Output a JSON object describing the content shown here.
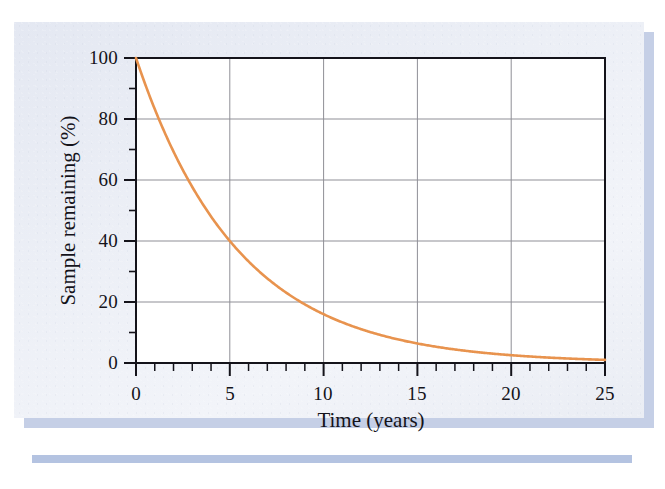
{
  "figure": {
    "kind": "scientific-figure-scan",
    "card_background": "#e9ecf4",
    "shadow_color": "#aebddd",
    "plot_background": "#ffffff"
  },
  "chart_data": {
    "type": "line",
    "title": "",
    "subtitle": "",
    "xlabel": "Time (years)",
    "ylabel": "Sample remaining (%)",
    "xlim": [
      0,
      25
    ],
    "ylim": [
      0,
      100
    ],
    "x_major_ticks": [
      0,
      5,
      10,
      15,
      20,
      25
    ],
    "x_major_tick_labels": [
      "0",
      "5",
      "10",
      "15",
      "20",
      "25"
    ],
    "x_minor_tick_step": 1,
    "y_major_ticks": [
      0,
      20,
      40,
      60,
      80,
      100
    ],
    "y_major_tick_labels": [
      "0",
      "20",
      "40",
      "60",
      "80",
      "100"
    ],
    "y_minor_ticks": [
      10,
      30,
      50,
      70,
      90
    ],
    "grid": "major-xy",
    "grid_color": "#8f8f96",
    "axis_color": "#14131a",
    "legend": null,
    "legend_position": "none",
    "annotations": [],
    "series": [
      {
        "name": "Sample remaining",
        "color": "#e8934e",
        "line_width": 2.6,
        "model": "exponential decay: 100 * exp(-0.1833 * t)",
        "half_life_years": 3.78,
        "x": [
          0,
          1,
          2,
          3,
          4,
          5,
          6,
          7,
          8,
          9,
          10,
          11,
          12,
          13,
          14,
          15,
          16,
          17,
          18,
          19,
          20,
          21,
          22,
          23,
          24,
          25
        ],
        "values": [
          100,
          83.3,
          69.4,
          57.8,
          48.1,
          40.0,
          33.3,
          27.8,
          23.1,
          19.3,
          16.0,
          13.4,
          11.1,
          9.3,
          7.7,
          6.4,
          5.3,
          4.4,
          3.7,
          3.1,
          2.6,
          2.1,
          1.8,
          1.5,
          1.2,
          1.0
        ]
      }
    ]
  },
  "axis_labels": {
    "y": [
      "100",
      "80",
      "60",
      "40",
      "20",
      "0"
    ],
    "x": [
      "0",
      "5",
      "10",
      "15",
      "20",
      "25"
    ]
  }
}
